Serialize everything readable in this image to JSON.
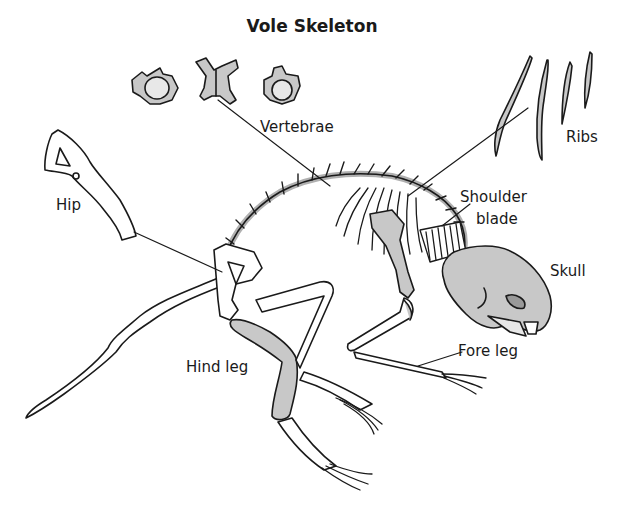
{
  "title": "Vole Skeleton",
  "labels": {
    "vertebrae": "Vertebrae",
    "ribs": "Ribs",
    "hip": "Hip",
    "shoulder_blade_line1": "Shoulder",
    "shoulder_blade_line2": "blade",
    "skull": "Skull",
    "fore_leg": "Fore leg",
    "hind_leg": "Hind leg"
  },
  "colors": {
    "outline": "#1a1a1a",
    "bone_fill": "#c8c8c8",
    "background": "#ffffff"
  }
}
